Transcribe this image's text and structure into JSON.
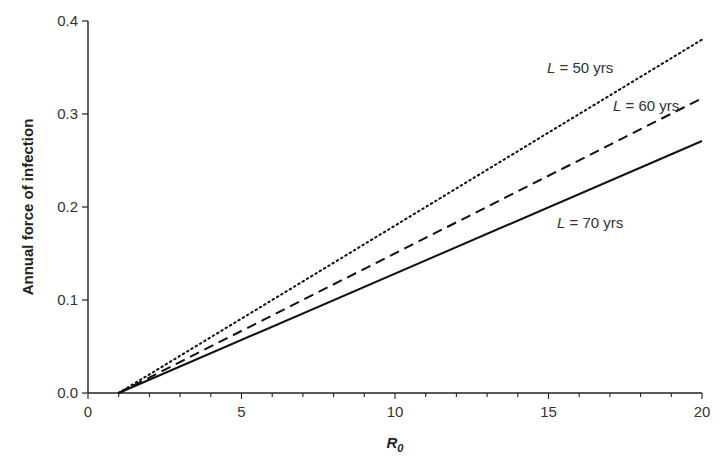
{
  "chart_data": {
    "type": "line",
    "title": "",
    "xlabel": "R0",
    "xlabel_main": "R",
    "xlabel_sub": "0",
    "ylabel": "Annual force of infection",
    "xlim": [
      0,
      20
    ],
    "ylim": [
      0,
      0.4
    ],
    "x_ticks": [
      0,
      5,
      10,
      15,
      20
    ],
    "x_tick_labels": [
      "0",
      "5",
      "10",
      "15",
      "20"
    ],
    "y_ticks": [
      0.0,
      0.1,
      0.2,
      0.3,
      0.4
    ],
    "y_tick_labels": [
      "0.0",
      "0.1",
      "0.2",
      "0.3",
      "0.4"
    ],
    "grid": false,
    "legend": "inline labels",
    "x": [
      1,
      20
    ],
    "series": [
      {
        "name": "L = 50 yrs",
        "L_label": "L",
        "rest_label": " = 50 yrs",
        "style": "dotted",
        "values": [
          0.0,
          0.38
        ]
      },
      {
        "name": "L = 60 yrs",
        "L_label": "L",
        "rest_label": " = 60 yrs",
        "style": "dashed",
        "values": [
          0.0,
          0.317
        ]
      },
      {
        "name": "L = 70 yrs",
        "L_label": "L",
        "rest_label": " = 70 yrs",
        "style": "solid",
        "values": [
          0.0,
          0.271
        ]
      }
    ]
  }
}
